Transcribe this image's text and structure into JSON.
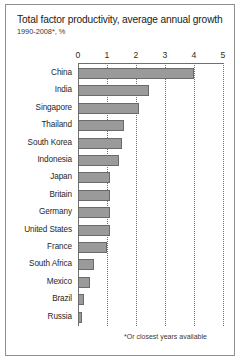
{
  "chart_data": {
    "type": "bar",
    "orientation": "horizontal",
    "title": "Total factor productivity, average annual growth",
    "subtitle": "1990-2008*, %",
    "footnote": "*Or closest years available",
    "xlabel": "",
    "ylabel": "",
    "xlim": [
      0,
      5
    ],
    "xticks": [
      "0",
      "1",
      "2",
      "3",
      "4",
      "5"
    ],
    "grid": true,
    "legend": "none",
    "bar_color": "#9a9a9a",
    "categories": [
      "China",
      "India",
      "Singapore",
      "Thailand",
      "South Korea",
      "Indonesia",
      "Japan",
      "Britain",
      "Germany",
      "United States",
      "France",
      "South Africa",
      "Mexico",
      "Brazil",
      "Russia"
    ],
    "values": [
      4.0,
      2.45,
      2.1,
      1.6,
      1.5,
      1.4,
      1.1,
      1.1,
      1.1,
      1.1,
      1.0,
      0.55,
      0.4,
      0.2,
      0.15
    ]
  }
}
